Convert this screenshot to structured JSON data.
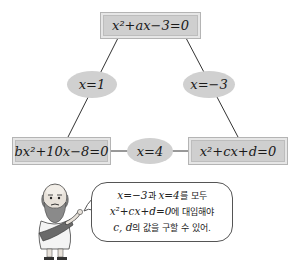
{
  "diagram": {
    "top_box": {
      "text": "x²+ax−3=0"
    },
    "root_left_branch": {
      "label": "x=1"
    },
    "root_right_branch": {
      "label": "x=−3"
    },
    "bottom_left_box": {
      "text": "bx²+10x−8=0"
    },
    "bottom_link": {
      "label": "x=4"
    },
    "bottom_right_box": {
      "text": "x²+cx+d=0"
    }
  },
  "speech_bubble": {
    "lines": [
      {
        "math1": "x=−3",
        "kr1": "과 ",
        "math2": "x=4",
        "kr2": "를 모두"
      },
      {
        "math1": "x²+cx+d=0",
        "kr1": "에 대입해야"
      },
      {
        "math1": "c, d",
        "kr1": "의 값을 구할 수 있어."
      }
    ]
  },
  "character": {
    "description": "bald bearded philosopher in toga pointing"
  },
  "colors": {
    "box_fill": "#cfcfcf",
    "box_border": "#b4b4b4",
    "ellipse_fill": "#d0d0d0",
    "line": "#333333"
  }
}
